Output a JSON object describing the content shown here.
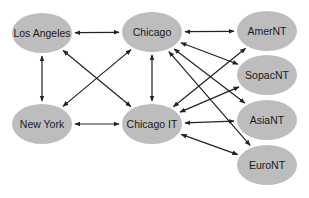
{
  "diagram": {
    "type": "network",
    "node_fill": "#bdbdbd",
    "edge_color": "#222222",
    "nodes": [
      {
        "id": "la",
        "label": "Los Angeles",
        "cx": 42,
        "cy": 33,
        "rx": 30,
        "ry": 20
      },
      {
        "id": "chi",
        "label": "Chicago",
        "cx": 152,
        "cy": 32,
        "rx": 30,
        "ry": 20
      },
      {
        "id": "ny",
        "label": "New York",
        "cx": 42,
        "cy": 124,
        "rx": 30,
        "ry": 20
      },
      {
        "id": "cit",
        "label": "Chicago IT",
        "cx": 152,
        "cy": 124,
        "rx": 30,
        "ry": 20
      },
      {
        "id": "amer",
        "label": "AmerNT",
        "cx": 267,
        "cy": 31,
        "rx": 30,
        "ry": 20
      },
      {
        "id": "sopac",
        "label": "SopacNT",
        "cx": 267,
        "cy": 75,
        "rx": 30,
        "ry": 20
      },
      {
        "id": "asia",
        "label": "AsiaNT",
        "cx": 267,
        "cy": 120,
        "rx": 30,
        "ry": 20
      },
      {
        "id": "euro",
        "label": "EuroNT",
        "cx": 267,
        "cy": 165,
        "rx": 30,
        "ry": 20
      }
    ],
    "edges": [
      {
        "from": "la",
        "to": "chi",
        "bidirectional": true
      },
      {
        "from": "la",
        "to": "ny",
        "bidirectional": true
      },
      {
        "from": "la",
        "to": "cit",
        "bidirectional": true
      },
      {
        "from": "ny",
        "to": "chi",
        "bidirectional": true
      },
      {
        "from": "ny",
        "to": "cit",
        "bidirectional": true
      },
      {
        "from": "chi",
        "to": "cit",
        "bidirectional": true
      },
      {
        "from": "chi",
        "to": "amer",
        "bidirectional": true
      },
      {
        "from": "chi",
        "to": "sopac",
        "bidirectional": true
      },
      {
        "from": "chi",
        "to": "asia",
        "bidirectional": true
      },
      {
        "from": "chi",
        "to": "euro",
        "bidirectional": true
      },
      {
        "from": "cit",
        "to": "amer",
        "bidirectional": true
      },
      {
        "from": "cit",
        "to": "sopac",
        "bidirectional": true
      },
      {
        "from": "cit",
        "to": "asia",
        "bidirectional": true
      },
      {
        "from": "cit",
        "to": "euro",
        "bidirectional": true
      }
    ]
  }
}
